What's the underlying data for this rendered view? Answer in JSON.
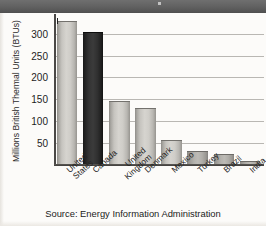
{
  "chart_data": {
    "type": "bar",
    "title": "",
    "xlabel": "",
    "ylabel": "Millions British Thermal Units (BTUs)",
    "categories": [
      "United States",
      "Canada",
      "United Kingdom",
      "Denmark",
      "Mexico",
      "Turkey",
      "Brazil",
      "India"
    ],
    "category_lines": [
      [
        "United",
        "States"
      ],
      [
        "Canada"
      ],
      [
        "United",
        "Kingdom"
      ],
      [
        "Denmark"
      ],
      [
        "Mexico"
      ],
      [
        "Turkey"
      ],
      [
        "Brazil"
      ],
      [
        "India"
      ]
    ],
    "values": [
      327,
      301,
      145,
      129,
      56,
      30,
      22,
      8
    ],
    "ylim": [
      0,
      345
    ],
    "yticks": [
      50,
      100,
      150,
      200,
      250,
      300
    ],
    "ytick_labels": [
      "50",
      "100",
      "150",
      "200",
      "250",
      "300"
    ],
    "grid": true,
    "legend": "none",
    "bar_styles": [
      "light",
      "dark",
      "light",
      "light",
      "light",
      "mid",
      "mid",
      "mid"
    ],
    "colors": {
      "bar_light": "#d6d4cf",
      "bar_dark": "#2b2b2b",
      "bar_mid": "#b4b2ad",
      "gridline": "#b9b7b3",
      "axis": "#4a4846",
      "text": "#1d1d1d",
      "background": "#fcfbf9"
    }
  },
  "source_note": "Source: Energy Information Administration"
}
